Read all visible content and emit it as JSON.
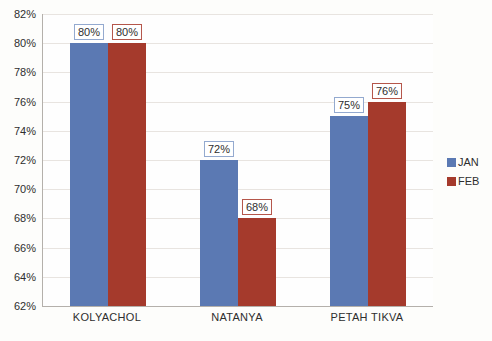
{
  "chart_data": {
    "type": "bar",
    "title": "",
    "xlabel": "",
    "ylabel": "",
    "categories": [
      "KOLYACHOL",
      "NATANYA",
      "PETAH TIKVA"
    ],
    "series": [
      {
        "name": "JAN",
        "color": "#5b79b3",
        "label_border": "#93a9cf",
        "values": [
          80,
          72,
          75
        ]
      },
      {
        "name": "FEB",
        "color": "#a53a2c",
        "label_border": "#b5564a",
        "values": [
          80,
          68,
          76
        ]
      }
    ],
    "data_labels": [
      [
        "80%",
        "72%",
        "75%"
      ],
      [
        "80%",
        "68%",
        "76%"
      ]
    ],
    "ylim": [
      62,
      82
    ],
    "ytick_step": 2,
    "ytick_labels": [
      "82%",
      "80%",
      "78%",
      "76%",
      "74%",
      "72%",
      "70%",
      "68%",
      "66%",
      "64%",
      "62%"
    ],
    "grid": true,
    "legend_position": "right"
  },
  "colors": {
    "axis_line": "#b4b0ab",
    "gridline": "#e8e4e0",
    "text": "#2e2e2e",
    "background": "#fdfdfb"
  }
}
